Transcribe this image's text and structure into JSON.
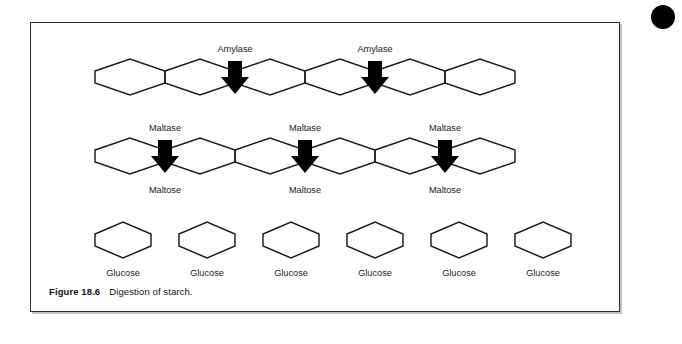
{
  "figure": {
    "caption_number": "Figure 18.6",
    "caption_text": "Digestion of starch.",
    "border_color": "#2b2b2b",
    "background": "#ffffff"
  },
  "marks": {
    "corner_dot": "bullet-dot",
    "corner_dot_color": "#000000"
  },
  "diagram": {
    "type": "process-diagram",
    "title": "Digestion of starch",
    "stroke_color": "#1a1a1a",
    "arrow_color": "#000000",
    "rows": [
      {
        "id": "starch-row",
        "substance": "starch",
        "unit_count": 6,
        "units": [
          {
            "label": ""
          },
          {
            "label": ""
          },
          {
            "label": ""
          },
          {
            "label": ""
          },
          {
            "label": ""
          },
          {
            "label": ""
          }
        ],
        "enzyme_arrows": [
          {
            "label": "Amylase",
            "after_unit": 2
          },
          {
            "label": "Amylase",
            "after_unit": 4
          }
        ]
      },
      {
        "id": "maltose-row",
        "substance": "maltose",
        "group_count": 3,
        "groups": [
          {
            "enzyme": "Maltase",
            "product": "Maltose"
          },
          {
            "enzyme": "Maltase",
            "product": "Maltose"
          },
          {
            "enzyme": "Maltase",
            "product": "Maltose"
          }
        ]
      },
      {
        "id": "glucose-row",
        "substance": "glucose",
        "unit_count": 6,
        "units": [
          {
            "label": "Glucose"
          },
          {
            "label": "Glucose"
          },
          {
            "label": "Glucose"
          },
          {
            "label": "Glucose"
          },
          {
            "label": "Glucose"
          },
          {
            "label": "Glucose"
          }
        ]
      }
    ]
  }
}
